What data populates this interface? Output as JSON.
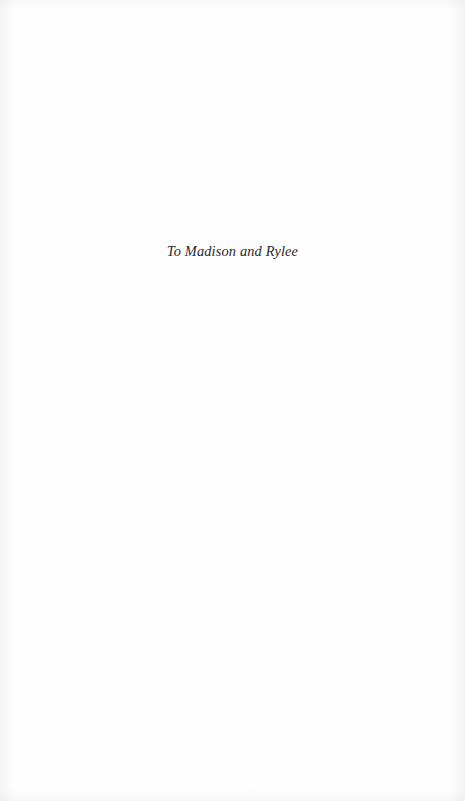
{
  "document": {
    "type": "book-dedication-page",
    "page_background_color": "#fefefe"
  },
  "dedication": {
    "text": "To Madison and Rylee",
    "text_color": "#2a2a2a",
    "alignment": "center",
    "style": "italic-serif"
  }
}
